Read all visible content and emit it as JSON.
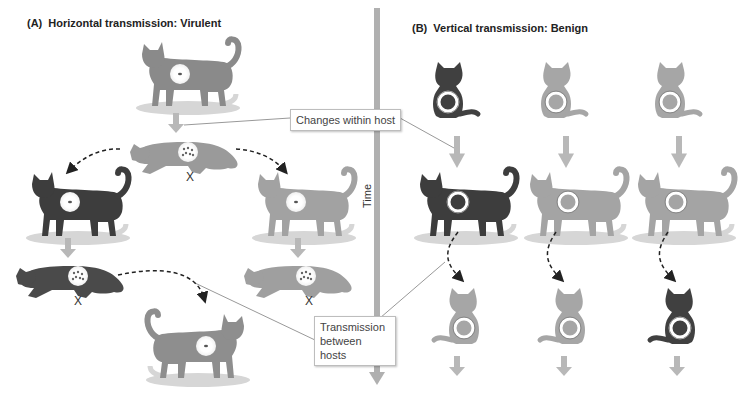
{
  "panel_a": {
    "label": "(A)",
    "title": "Horizontal transmission: Virulent",
    "dead_marker": "X",
    "hosts": [
      {
        "id": "a-top",
        "pose": "standing",
        "shade": "medium",
        "infection": "low"
      },
      {
        "id": "a-middle-dying",
        "pose": "lying",
        "shade": "light",
        "infection": "high",
        "dead": true
      },
      {
        "id": "a-left",
        "pose": "standing",
        "shade": "dark",
        "infection": "low"
      },
      {
        "id": "a-right",
        "pose": "standing",
        "shade": "light",
        "infection": "low"
      },
      {
        "id": "a-left-dying",
        "pose": "lying",
        "shade": "dark",
        "infection": "high",
        "dead": true
      },
      {
        "id": "a-right-dying",
        "pose": "lying",
        "shade": "light",
        "infection": "high",
        "dead": true
      },
      {
        "id": "a-bottom",
        "pose": "standing",
        "shade": "medium",
        "infection": "low"
      }
    ]
  },
  "panel_b": {
    "label": "(B)",
    "title": "Vertical transmission: Benign",
    "columns": [
      {
        "kitten_shade": "dark",
        "adult_shade": "dark",
        "offspring_shade": "light"
      },
      {
        "kitten_shade": "light",
        "adult_shade": "light",
        "offspring_shade": "light"
      },
      {
        "kitten_shade": "light",
        "adult_shade": "light",
        "offspring_shade": "dark"
      }
    ]
  },
  "axis": {
    "label": "Time"
  },
  "callouts": {
    "changes": "Changes within host",
    "transmission_line1": "Transmission",
    "transmission_line2": "between",
    "transmission_line3": "hosts"
  },
  "colors": {
    "arrow": "#b8b8b8",
    "time_axis": "#b0b0b0",
    "dark_cat": "#3d3d3d",
    "medium_cat": "#8a8a8a",
    "light_cat": "#a7a7a7",
    "shadow": "#d6d6d6",
    "dashed_arrow": "#222222"
  }
}
